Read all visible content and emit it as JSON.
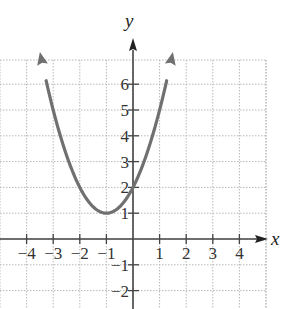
{
  "chart_data": {
    "type": "line",
    "title": "",
    "function": "y = (x + 1)^2 + 1",
    "xlabel": "x",
    "ylabel": "y",
    "xlim": [
      -5,
      5
    ],
    "ylim": [
      -2.5,
      7
    ],
    "grid": true,
    "x_ticks": [
      -4,
      -3,
      -2,
      -1,
      1,
      2,
      3,
      4
    ],
    "x_tick_labels": [
      "−4",
      "−3",
      "−2",
      "−1",
      "1",
      "2",
      "3",
      "4"
    ],
    "y_ticks": [
      -2,
      -1,
      1,
      2,
      3,
      4,
      5,
      6
    ],
    "y_tick_labels": [
      "−2",
      "−1",
      "1",
      "2",
      "3",
      "4",
      "5",
      "6"
    ],
    "vertex": [
      -1,
      1
    ],
    "y_intercept": [
      0,
      2
    ],
    "series": [
      {
        "name": "parabola",
        "x": [
          -3.45,
          -3,
          -2.5,
          -2,
          -1.5,
          -1,
          -0.5,
          0,
          0.5,
          1,
          1.45
        ],
        "y": [
          7.0,
          5.0,
          3.25,
          2.0,
          1.25,
          1.0,
          1.25,
          2.0,
          3.25,
          5.0,
          7.0
        ],
        "color": "#707070",
        "arrows_both_ends": true
      }
    ]
  },
  "colors": {
    "curve": "#707070",
    "axis": "#444444",
    "grid": "#b8b8b8"
  }
}
